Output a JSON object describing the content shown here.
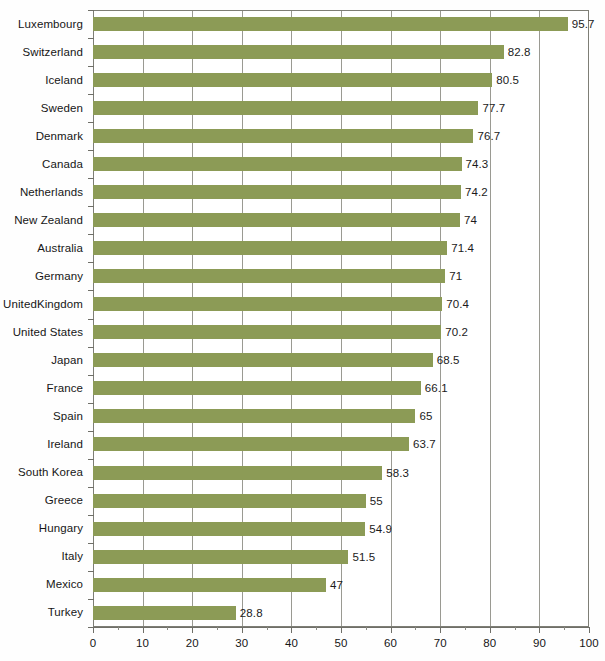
{
  "chart_data": {
    "type": "bar",
    "orientation": "horizontal",
    "title": "",
    "xlabel": "",
    "ylabel": "",
    "xlim": [
      0,
      100
    ],
    "xticks": [
      0,
      10,
      20,
      30,
      40,
      50,
      60,
      70,
      80,
      90,
      100
    ],
    "xtick_labels": [
      "0",
      "10",
      "20",
      "30",
      "40",
      "50",
      "60",
      "70",
      "80",
      "90",
      "100"
    ],
    "grid": true,
    "grid_axis": "x",
    "legend": null,
    "bar_color": "#8c9b56",
    "categories": [
      "Luxembourg",
      "Switzerland",
      "Iceland",
      "Sweden",
      "Denmark",
      "Canada",
      "Netherlands",
      "New Zealand",
      "Australia",
      "Germany",
      "United Kingdom",
      "United States",
      "Japan",
      "France",
      "Spain",
      "Ireland",
      "South Korea",
      "Greece",
      "Hungary",
      "Italy",
      "Mexico",
      "Turkey"
    ],
    "values": [
      95.7,
      82.8,
      80.5,
      77.7,
      76.7,
      74.3,
      74.2,
      74,
      71.4,
      71,
      70.4,
      70.2,
      68.5,
      66.1,
      65,
      63.7,
      58.3,
      55,
      54.9,
      51.5,
      47,
      28.8
    ],
    "value_labels": [
      "95.7",
      "82.8",
      "80.5",
      "77.7",
      "76.7",
      "74.3",
      "74.2",
      "74",
      "71.4",
      "71",
      "70.4",
      "70.2",
      "68.5",
      "66.1",
      "65",
      "63.7",
      "58.3",
      "55",
      "54.9",
      "51.5",
      "47",
      "28.8"
    ],
    "category_label_lines": [
      [
        "Luxembourg"
      ],
      [
        "Switzerland"
      ],
      [
        "Iceland"
      ],
      [
        "Sweden"
      ],
      [
        "Denmark"
      ],
      [
        "Canada"
      ],
      [
        "Netherlands"
      ],
      [
        "New Zealand"
      ],
      [
        "Australia"
      ],
      [
        "Germany"
      ],
      [
        "United",
        "Kingdom"
      ],
      [
        "United States"
      ],
      [
        "Japan"
      ],
      [
        "France"
      ],
      [
        "Spain"
      ],
      [
        "Ireland"
      ],
      [
        "South Korea"
      ],
      [
        "Greece"
      ],
      [
        "Hungary"
      ],
      [
        "Italy"
      ],
      [
        "Mexico"
      ],
      [
        "Turkey"
      ]
    ]
  }
}
